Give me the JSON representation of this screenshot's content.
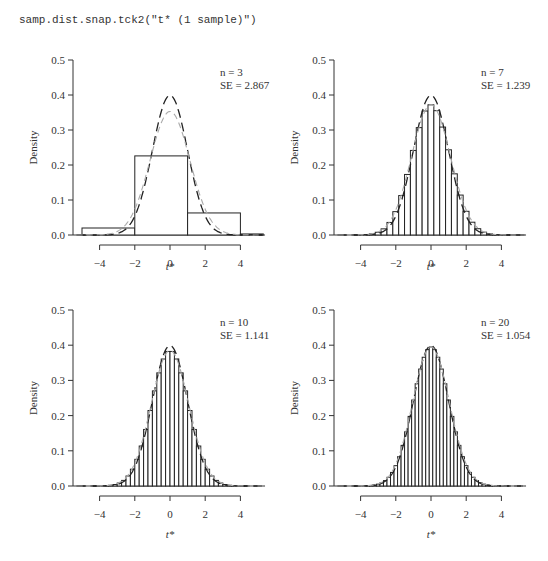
{
  "command": "samp.dist.snap.tck2(\"t* (1 sample)\")",
  "chart_data": [
    {
      "type": "bar",
      "title": "",
      "annotation": {
        "n_label": "n = 3",
        "se_label": "SE = 2.867"
      },
      "xlabel": "t*",
      "ylabel": "Density",
      "xticks": [
        "-4",
        "-2",
        "0",
        "2",
        "4"
      ],
      "yticks": [
        "0.0",
        "0.1",
        "0.2",
        "0.3",
        "0.4",
        "0.5"
      ],
      "xlim": [
        -5.3,
        5.3
      ],
      "ylim": [
        0,
        0.5
      ],
      "bins": [
        [
          -5,
          -2,
          0.02
        ],
        [
          -2,
          1,
          0.226
        ],
        [
          1,
          4,
          0.063
        ],
        [
          4,
          5.3,
          0.003
        ]
      ],
      "curves": [
        {
          "name": "standard normal (dark dashed)",
          "sd": 1.0,
          "peak": 0.399
        },
        {
          "name": "t density (grey dashed)",
          "sd": 1.13,
          "peak": 0.353
        }
      ]
    },
    {
      "type": "bar",
      "annotation": {
        "n_label": "n = 7",
        "se_label": "SE = 1.239"
      },
      "xlabel": "t*",
      "ylabel": "Density",
      "xticks": [
        "-4",
        "-2",
        "0",
        "2",
        "4"
      ],
      "yticks": [
        "0.0",
        "0.1",
        "0.2",
        "0.3",
        "0.4",
        "0.5"
      ],
      "xlim": [
        -5.3,
        5.3
      ],
      "ylim": [
        0,
        0.5
      ],
      "bin_width": 0.333,
      "range": [
        -4.5,
        4.5
      ],
      "hist_sd": 1.08,
      "hist_peak": 0.372
    },
    {
      "type": "bar",
      "annotation": {
        "n_label": "n = 10",
        "se_label": "SE = 1.141"
      },
      "xlabel": "t*",
      "ylabel": "Density",
      "xticks": [
        "-4",
        "-2",
        "0",
        "2",
        "4"
      ],
      "yticks": [
        "0.0",
        "0.1",
        "0.2",
        "0.3",
        "0.4",
        "0.5"
      ],
      "xlim": [
        -5.3,
        5.3
      ],
      "ylim": [
        0,
        0.5
      ],
      "bin_width": 0.25,
      "range": [
        -4.5,
        4.5
      ],
      "hist_sd": 1.04,
      "hist_peak": 0.385
    },
    {
      "type": "bar",
      "annotation": {
        "n_label": "n = 20",
        "se_label": "SE = 1.054"
      },
      "xlabel": "t*",
      "ylabel": "Density",
      "xticks": [
        "-4",
        "-2",
        "0",
        "2",
        "4"
      ],
      "yticks": [
        "0.0",
        "0.1",
        "0.2",
        "0.3",
        "0.4",
        "0.5"
      ],
      "xlim": [
        -5.3,
        5.3
      ],
      "ylim": [
        0,
        0.5
      ],
      "bin_width": 0.2,
      "range": [
        -4.5,
        4.5
      ],
      "hist_sd": 1.02,
      "hist_peak": 0.395
    }
  ],
  "panels_layout": [
    {
      "ox": 73,
      "x0": 170,
      "y0": 235,
      "ytop": 60,
      "labx": 170,
      "laby": 270
    },
    {
      "ox": 334,
      "x0": 431,
      "y0": 235,
      "ytop": 60,
      "labx": 431,
      "laby": 270
    },
    {
      "ox": 73,
      "x0": 170,
      "y0": 486,
      "ytop": 310,
      "labx": 170,
      "laby": 538
    },
    {
      "ox": 334,
      "x0": 431,
      "y0": 486,
      "ytop": 310,
      "labx": 431,
      "laby": 538
    }
  ]
}
